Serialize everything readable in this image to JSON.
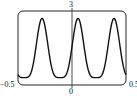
{
  "chart_data": {
    "type": "line",
    "title": "",
    "xlabel": "",
    "ylabel": "",
    "xlim": [
      -0.5,
      0.5
    ],
    "ylim": [
      0,
      3
    ],
    "grid": false,
    "tick_labels": {
      "x_min": "−0.5",
      "x_zero": "0",
      "x_max": "0.5",
      "y_max": "3"
    },
    "series": [
      {
        "name": "curve",
        "period": 0.333,
        "peaks_x": [
          -0.24,
          0.056,
          0.389
        ],
        "troughs_x": [
          -0.39,
          -0.09,
          0.24
        ],
        "peak_y": 2.7,
        "trough_y": 0.3,
        "x": [
          -0.5,
          -0.45,
          -0.39,
          -0.32,
          -0.24,
          -0.17,
          -0.09,
          -0.02,
          0.056,
          0.13,
          0.24,
          0.31,
          0.389,
          0.45,
          0.5
        ],
        "y": [
          1.3,
          0.6,
          0.3,
          1.0,
          2.7,
          1.0,
          0.3,
          1.0,
          2.7,
          1.0,
          0.3,
          1.0,
          2.7,
          1.2,
          0.45
        ]
      }
    ]
  },
  "labels": {
    "y_top": "3",
    "x_left": "−0.5",
    "x_center": "0",
    "x_right": "0.5"
  }
}
